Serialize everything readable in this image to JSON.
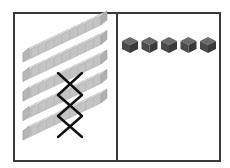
{
  "diagram": {
    "left_panel": {
      "label": "tens",
      "rod_count": 5,
      "cubes_per_rod": 10,
      "crossed_out_rods": [
        3,
        4,
        5
      ],
      "rod_color": "#c8c8c8",
      "cross_color": "#111111"
    },
    "right_panel": {
      "label": "ones",
      "cube_count": 5,
      "cube_color": "#4a4a4a"
    },
    "border_color": "#3a3a3a"
  }
}
